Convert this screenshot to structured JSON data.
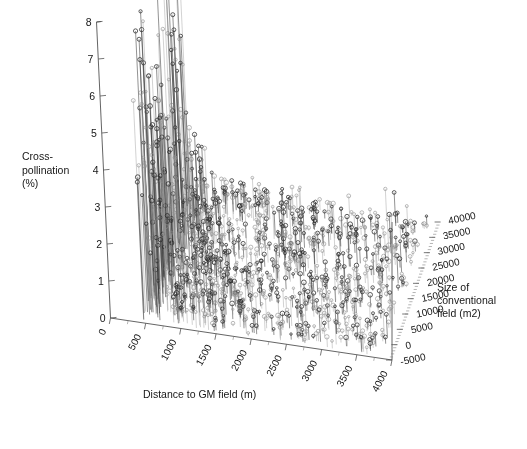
{
  "figure": {
    "background": "#ffffff",
    "ink_color": "#2e2e2e",
    "axis_color": "#555555"
  },
  "axes": {
    "z": {
      "title_lines": [
        "Cross-",
        "pollination",
        "(%)"
      ],
      "ticks": [
        "0",
        "1",
        "2",
        "3",
        "4",
        "5",
        "6",
        "7",
        "8"
      ],
      "range": [
        0,
        8
      ]
    },
    "x": {
      "title": "Distance to GM field (m)",
      "ticks": [
        "0",
        "500",
        "1000",
        "1500",
        "2000",
        "2500",
        "3000",
        "3500",
        "4000"
      ],
      "range": [
        0,
        4000
      ]
    },
    "y": {
      "title_lines": [
        "Size of",
        "conventional",
        "field (m2)"
      ],
      "ticks": [
        "-5000",
        "0",
        "5000",
        "10000",
        "15000",
        "20000",
        "25000",
        "30000",
        "35000",
        "40000"
      ],
      "range": [
        -5000,
        40000
      ]
    }
  },
  "chart_data": {
    "type": "scatter",
    "title": "",
    "xlabel": "Distance to GM field (m)",
    "ylabel": "Size of conventional field (m2)",
    "zlabel": "Cross-pollination (%)",
    "xlim": [
      0,
      4000
    ],
    "ylim": [
      -5000,
      40000
    ],
    "zlim": [
      0,
      8
    ],
    "grid": false,
    "legend": "none",
    "marker": "open-circle",
    "droplines": true,
    "projection": "3d",
    "series": [
      {
        "name": "Cross-pollination observations",
        "points": [
          [
            430,
            2000,
            7.3
          ],
          [
            455,
            3000,
            6.45
          ],
          [
            470,
            5000,
            6.2
          ],
          [
            480,
            8000,
            5.6
          ],
          [
            495,
            4000,
            5.1
          ],
          [
            505,
            11000,
            4.75
          ],
          [
            515,
            6000,
            4.4
          ],
          [
            525,
            14000,
            4.05
          ],
          [
            535,
            9000,
            3.75
          ],
          [
            545,
            3000,
            3.45
          ],
          [
            555,
            17000,
            3.2
          ],
          [
            565,
            7000,
            2.95
          ],
          [
            575,
            12000,
            2.7
          ],
          [
            590,
            5000,
            2.45
          ],
          [
            600,
            20000,
            2.25
          ],
          [
            615,
            9000,
            2.05
          ],
          [
            630,
            15000,
            1.88
          ],
          [
            645,
            4000,
            1.7
          ],
          [
            660,
            11000,
            1.55
          ],
          [
            680,
            23000,
            1.42
          ],
          [
            700,
            7000,
            1.3
          ],
          [
            720,
            17000,
            1.18
          ],
          [
            740,
            13000,
            1.08
          ],
          [
            760,
            6000,
            0.99
          ],
          [
            785,
            26000,
            0.91
          ],
          [
            810,
            10000,
            0.84
          ],
          [
            835,
            19000,
            0.78
          ],
          [
            860,
            15000,
            0.72
          ],
          [
            890,
            8000,
            0.67
          ],
          [
            920,
            22000,
            0.63
          ],
          [
            950,
            12000,
            0.59
          ],
          [
            985,
            29000,
            0.56
          ],
          [
            1020,
            17000,
            0.53
          ],
          [
            1060,
            9000,
            0.5
          ],
          [
            1100,
            24000,
            0.48
          ],
          [
            1145,
            14000,
            0.46
          ],
          [
            1190,
            19000,
            0.44
          ],
          [
            1240,
            7000,
            0.43
          ],
          [
            1290,
            31000,
            0.41
          ],
          [
            1340,
            16000,
            0.4
          ],
          [
            1395,
            11000,
            0.39
          ],
          [
            1450,
            26000,
            0.38
          ],
          [
            1510,
            20000,
            0.37
          ],
          [
            1570,
            8000,
            0.36
          ],
          [
            1635,
            34000,
            0.35
          ],
          [
            1700,
            14000,
            0.35
          ],
          [
            1770,
            23000,
            0.34
          ],
          [
            1840,
            18000,
            0.34
          ],
          [
            1915,
            10000,
            0.33
          ],
          [
            1990,
            28000,
            0.33
          ],
          [
            2070,
            15000,
            0.32
          ],
          [
            2150,
            21000,
            0.32
          ],
          [
            2235,
            12000,
            0.31
          ],
          [
            2320,
            32000,
            0.31
          ],
          [
            2410,
            17000,
            0.3
          ],
          [
            2500,
            25000,
            0.3
          ],
          [
            2595,
            9000,
            0.29
          ],
          [
            2690,
            19000,
            0.29
          ],
          [
            2790,
            14000,
            0.28
          ],
          [
            2890,
            29000,
            0.28
          ],
          [
            2995,
            22000,
            0.27
          ],
          [
            3100,
            11000,
            0.27
          ],
          [
            3210,
            16000,
            0.26
          ],
          [
            3320,
            27000,
            0.26
          ],
          [
            3435,
            20000,
            0.25
          ],
          [
            3550,
            13000,
            0.25
          ],
          [
            3670,
            24000,
            0.24
          ],
          [
            3790,
            18000,
            0.24
          ]
        ],
        "peaks": [
          [
            1560,
            20000,
            1.45
          ],
          [
            1980,
            26000,
            1.1
          ],
          [
            2320,
            17000,
            1.25
          ],
          [
            2650,
            30000,
            0.95
          ],
          [
            2980,
            22000,
            1.35
          ],
          [
            3240,
            13000,
            0.85
          ],
          [
            3480,
            28000,
            1.05
          ],
          [
            3720,
            19000,
            0.75
          ]
        ]
      }
    ]
  }
}
